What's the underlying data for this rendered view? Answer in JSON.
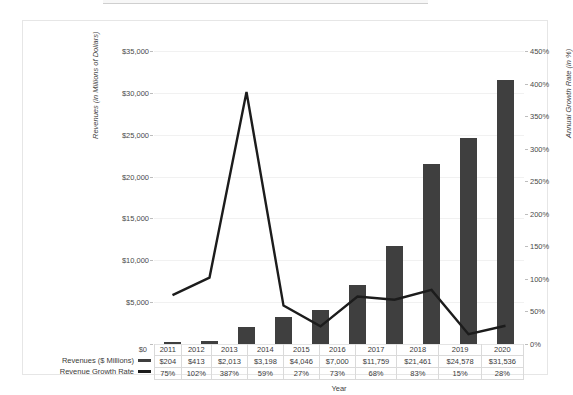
{
  "chart_data": {
    "type": "bar",
    "title": "",
    "xlabel": "Year",
    "ylabel": "Revenues (in Millions of Dollars)",
    "y2label": "Annual Growth Rate (in %)",
    "categories": [
      "2011",
      "2012",
      "2013",
      "2014",
      "2015",
      "2016",
      "2017",
      "2018",
      "2019",
      "2020"
    ],
    "series": [
      {
        "name": "Revenues ($ Millions)",
        "axis": "left",
        "render": "bar",
        "color": "#3f3f3f",
        "values": [
          204,
          413,
          2013,
          3198,
          4046,
          7000,
          11759,
          21461,
          24578,
          31536
        ],
        "labels": [
          "$204",
          "$413",
          "$2,013",
          "$3,198",
          "$4,046",
          "$7,000",
          "$11,759",
          "$21,461",
          "$24,578",
          "$31,536"
        ]
      },
      {
        "name": "Revenue Growth Rate",
        "axis": "right",
        "render": "line",
        "color": "#1c1c1c",
        "values": [
          75,
          102,
          387,
          59,
          27,
          73,
          68,
          83,
          15,
          28
        ],
        "labels": [
          "75%",
          "102%",
          "387%",
          "59%",
          "27%",
          "73%",
          "68%",
          "83%",
          "15%",
          "28%"
        ]
      }
    ],
    "ylim": [
      0,
      35000
    ],
    "yticks": [
      0,
      5000,
      10000,
      15000,
      20000,
      25000,
      30000,
      35000
    ],
    "ytick_labels": [
      "$0",
      "$5,000",
      "$10,000",
      "$15,000",
      "$20,000",
      "$25,000",
      "$30,000",
      "$35,000"
    ],
    "y2lim": [
      0,
      450
    ],
    "y2ticks": [
      0,
      50,
      100,
      150,
      200,
      250,
      300,
      350,
      400,
      450
    ],
    "y2tick_labels": [
      "0%",
      "50%",
      "100%",
      "150%",
      "200%",
      "250%",
      "300%",
      "350%",
      "400%",
      "450%"
    ],
    "grid": true,
    "legend_position": "bottom-left-table",
    "data_table_visible": true
  },
  "legend": {
    "revenues_label": "Revenues ($ Millions)",
    "growth_label": "Revenue Growth Rate"
  },
  "axis_titles": {
    "left": "Revenues (in Millions of Dollars)",
    "right": "Annual Growth Rate (in %)",
    "bottom": "Year"
  },
  "zero_tick": "$0"
}
